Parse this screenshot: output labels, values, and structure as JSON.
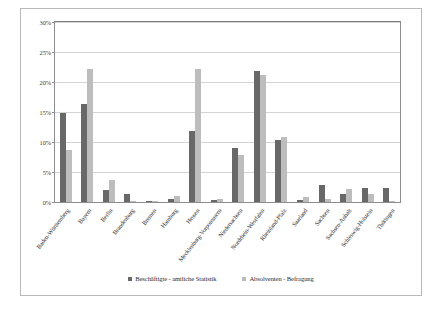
{
  "chart_data": {
    "type": "bar",
    "title": "",
    "xlabel": "",
    "ylabel": "",
    "ylim": [
      0,
      30
    ],
    "ytick_labels": [
      "0%",
      "5%",
      "10%",
      "15%",
      "20%",
      "25%",
      "30%"
    ],
    "ytick_values": [
      0,
      5,
      10,
      15,
      20,
      25,
      30
    ],
    "grid": true,
    "legend_position": "bottom",
    "categories": [
      "Baden-Württemberg",
      "Bayern",
      "Berlin",
      "Brandenburg",
      "Bremen",
      "Hamburg",
      "Hessen",
      "Mecklenburg-Vorpommern",
      "Niedersachsen",
      "Nordrhein-Westfalen",
      "Rheinland-Pfalz",
      "Saarland",
      "Sachsen",
      "Sachsen-Anhalt",
      "Schleswig-Holstein",
      "Thüringen"
    ],
    "series": [
      {
        "name": "Beschäftigte - amtliche Statistik",
        "color": "#686868",
        "values": [
          14.9,
          16.3,
          2.0,
          1.4,
          0.2,
          0.5,
          11.9,
          0.4,
          9.0,
          21.9,
          10.4,
          0.4,
          2.9,
          1.4,
          2.3,
          2.4
        ]
      },
      {
        "name": "Absolventen - Befragung",
        "color": "#bdbdbd",
        "values": [
          8.7,
          22.2,
          3.7,
          0.2,
          0.2,
          1.0,
          22.1,
          0.5,
          7.9,
          21.2,
          10.9,
          0.8,
          0.5,
          2.1,
          1.4,
          0.2
        ]
      }
    ]
  },
  "legend": {
    "items": [
      {
        "label": "Beschäftigte - amtliche Statistik"
      },
      {
        "label": "Absolventen - Befragung"
      }
    ]
  }
}
